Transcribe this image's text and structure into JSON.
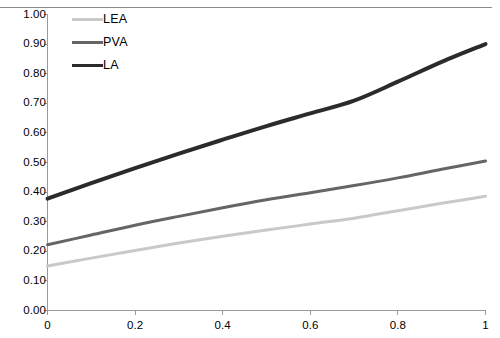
{
  "chart_data": {
    "type": "line",
    "title": "",
    "xlabel": "",
    "ylabel": "",
    "xlim": [
      0,
      1
    ],
    "ylim": [
      0,
      1
    ],
    "grid": false,
    "legend_position": "top-left",
    "x_ticks": [
      "0",
      "0.2",
      "0.4",
      "0.6",
      "0.8",
      "1"
    ],
    "x_tick_values": [
      0,
      0.2,
      0.4,
      0.6,
      0.8,
      1
    ],
    "y_ticks": [
      "0.00",
      "0.10",
      "0.20",
      "0.30",
      "0.40",
      "0.50",
      "0.60",
      "0.70",
      "0.80",
      "0.90",
      "1.00"
    ],
    "y_tick_values": [
      0,
      0.1,
      0.2,
      0.3,
      0.4,
      0.5,
      0.6,
      0.7,
      0.8,
      0.9,
      1.0
    ],
    "x": [
      0,
      0.1,
      0.2,
      0.3,
      0.4,
      0.5,
      0.6,
      0.7,
      0.8,
      0.9,
      1
    ],
    "series": [
      {
        "name": "LEA",
        "color": "#c9c9c9",
        "width": 3,
        "values": [
          0.15,
          0.177,
          0.203,
          0.228,
          0.251,
          0.272,
          0.292,
          0.312,
          0.337,
          0.362,
          0.386
        ]
      },
      {
        "name": "PVA",
        "color": "#656565",
        "width": 3,
        "values": [
          0.222,
          0.255,
          0.288,
          0.318,
          0.347,
          0.374,
          0.398,
          0.422,
          0.448,
          0.477,
          0.505
        ]
      },
      {
        "name": "LA",
        "color": "#2b2b2b",
        "width": 4,
        "values": [
          0.378,
          0.43,
          0.481,
          0.53,
          0.577,
          0.623,
          0.666,
          0.709,
          0.773,
          0.84,
          0.9
        ]
      }
    ]
  },
  "legend": {
    "items": [
      {
        "label": "LEA",
        "color": "#c9c9c9"
      },
      {
        "label": "PVA",
        "color": "#656565"
      },
      {
        "label": "LA",
        "color": "#2b2b2b"
      }
    ]
  },
  "axes": {
    "axis_color": "#9a9a9a",
    "tick_color": "#9a9a9a"
  }
}
